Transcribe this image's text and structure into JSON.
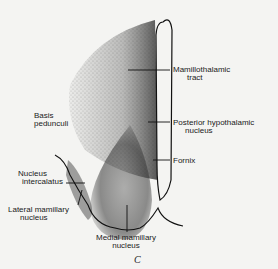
{
  "figure": {
    "panel_label": "C",
    "labels": {
      "mamillothalamic_tract": [
        "Mamillothalamic",
        "tract"
      ],
      "basis_pedunculi": [
        "Basis",
        "pedunculi"
      ],
      "posterior_hypothalamic_nucleus": [
        "Posterior hypothalamic",
        "nucleus"
      ],
      "fornix": "Fornix",
      "nucleus_intercalatus": [
        "Nucleus",
        "intercalatus"
      ],
      "lateral_mamillary_nucleus": [
        "Lateral mamillary",
        "nucleus"
      ],
      "medial_mamillary_nucleus": [
        "Medial mamillary",
        "nucleus"
      ]
    },
    "colors": {
      "ink": "#1a1a1a",
      "background": "#f4f4f2"
    }
  }
}
